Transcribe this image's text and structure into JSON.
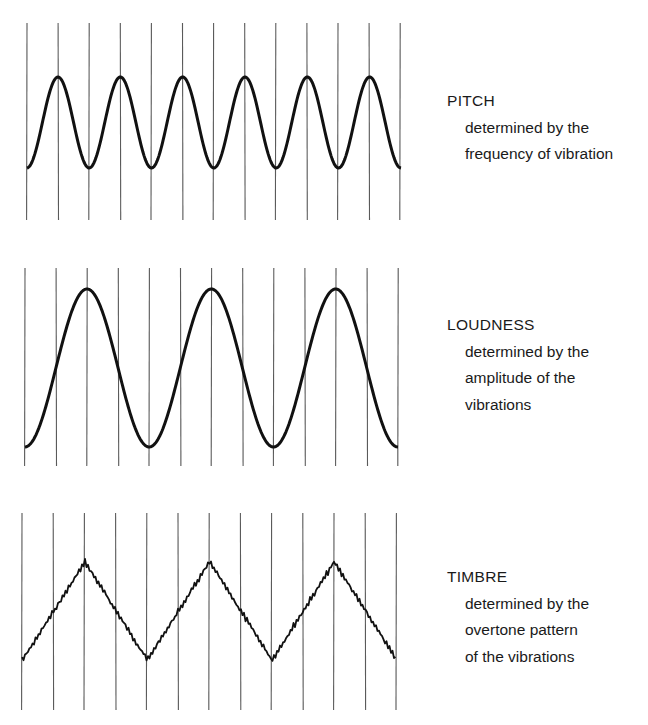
{
  "panels": [
    {
      "id": "pitch",
      "title": "PITCH",
      "description": [
        "determined by the",
        "frequency of vibration"
      ],
      "waveform": "sine",
      "grid": {
        "x_start": 27,
        "x_step": 31.1,
        "count": 13,
        "y_top": 23,
        "y_bottom": 220
      },
      "wave": {
        "x_start": 27,
        "x_end": 401,
        "y_peak": 77,
        "y_trough": 168,
        "cycles": 6,
        "first_peak_x": 58,
        "stroke_width": 3
      },
      "label_top": 88
    },
    {
      "id": "loudness",
      "title": "LOUDNESS",
      "description": [
        "determined by the",
        "amplitude of the",
        "vibrations"
      ],
      "waveform": "sine",
      "grid": {
        "x_start": 25,
        "x_step": 31.1,
        "count": 13,
        "y_top": 268,
        "y_bottom": 466
      },
      "wave": {
        "x_start": 25,
        "x_end": 398,
        "y_peak": 289,
        "y_trough": 447,
        "cycles": 3,
        "first_peak_x": 87,
        "stroke_width": 3
      },
      "label_top": 312
    },
    {
      "id": "timbre",
      "title": "TIMBRE",
      "description": [
        "determined by the",
        "overtone pattern",
        "of the vibrations"
      ],
      "waveform": "triangle-jagged",
      "grid": {
        "x_start": 22,
        "x_step": 31.2,
        "count": 13,
        "y_top": 513,
        "y_bottom": 710
      },
      "wave": {
        "x_start": 22,
        "x_end": 396,
        "y_peak": 562,
        "y_trough": 660,
        "cycles": 3,
        "first_peak_x": 85,
        "stroke_width": 1.8
      },
      "label_top": 564
    }
  ],
  "colors": {
    "grid": "#5a5a5a",
    "wave": "#111111",
    "text": "#1a1a1a"
  }
}
